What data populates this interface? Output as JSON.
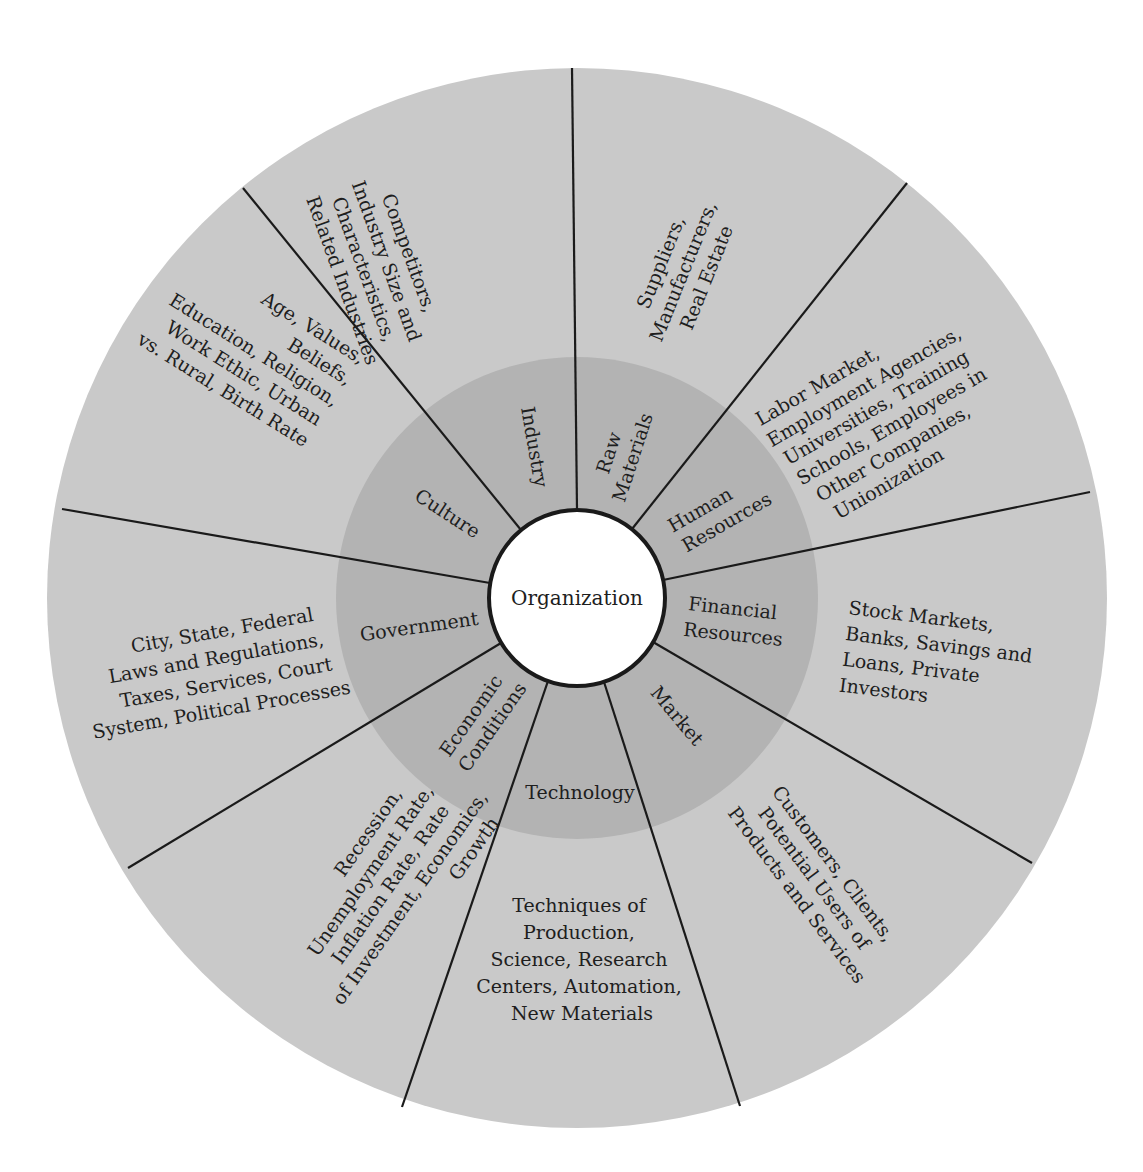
{
  "diagram": {
    "center": {
      "label": "Organization",
      "fill": "#ffffff"
    },
    "colors": {
      "outer_ring": "#c9c9c9",
      "inner_ring": "#b3b3b3",
      "divider": "#1a1a1a",
      "background": "#ffffff"
    },
    "geometry": {
      "cx": 577,
      "cy": 598,
      "outer_radius": 530,
      "inner_radius": 241,
      "center_radius": 88,
      "divider_angles_deg": [
        -90,
        -51.5,
        -11.5,
        30,
        72,
        109,
        149,
        -170,
        -129
      ]
    },
    "sectors": [
      {
        "name": "Raw Materials",
        "inner_lines": [
          "Raw",
          "Materials"
        ],
        "outer_lines": [
          "Suppliers,",
          "Manufacturers,",
          "Real Estate"
        ]
      },
      {
        "name": "Human Resources",
        "inner_lines": [
          "Human",
          "Resources"
        ],
        "outer_lines": [
          "Labor Market,",
          "Employment Agencies,",
          "Universities, Training",
          "Schools, Employees in",
          "Other Companies,",
          "Unionization"
        ]
      },
      {
        "name": "Financial Resources",
        "inner_lines": [
          "Financial",
          "Resources"
        ],
        "outer_lines": [
          "Stock Markets,",
          "Banks, Savings and",
          "Loans, Private",
          "Investors"
        ]
      },
      {
        "name": "Market",
        "inner_lines": [
          "Market"
        ],
        "outer_lines": [
          "Customers, Clients,",
          "Potential Users of",
          "Products and Services"
        ]
      },
      {
        "name": "Technology",
        "inner_lines": [
          "Technology"
        ],
        "outer_lines": [
          "Techniques of",
          "Production,",
          "Science, Research",
          "Centers, Automation,",
          "New Materials"
        ]
      },
      {
        "name": "Economic Conditions",
        "inner_lines": [
          "Economic",
          "Conditions"
        ],
        "outer_lines": [
          "Recession,",
          "Unemployment Rate,",
          "Inflation Rate, Rate",
          "of Investment, Economics,",
          "Growth"
        ]
      },
      {
        "name": "Government",
        "inner_lines": [
          "Government"
        ],
        "outer_lines": [
          "City, State, Federal",
          "Laws and Regulations,",
          "Taxes, Services, Court",
          "System, Political Processes"
        ]
      },
      {
        "name": "Culture",
        "inner_lines": [
          "Culture"
        ],
        "outer_lines": [
          "Age, Values,",
          "Beliefs,",
          "Education, Religion,",
          "Work Ethic, Urban",
          "vs. Rural, Birth Rate"
        ]
      },
      {
        "name": "Industry",
        "inner_lines": [
          "Industry"
        ],
        "outer_lines": [
          "Competitors,",
          "Industry Size and",
          "Characteristics,",
          "Related Industries"
        ]
      }
    ]
  }
}
